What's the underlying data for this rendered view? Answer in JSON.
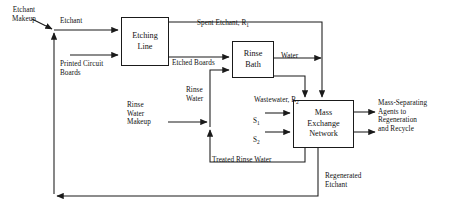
{
  "diagram": {
    "type": "process-flow-diagram",
    "stroke_color": "#1a1a1a",
    "text_color": "#111111",
    "background": "#ffffff",
    "boxes": [
      {
        "id": "etching-line",
        "label": "Etching\nLine",
        "x": 121,
        "y": 17,
        "w": 48,
        "h": 49
      },
      {
        "id": "rinse-bath",
        "label": "Rinse\nBath",
        "x": 232,
        "y": 41,
        "w": 42,
        "h": 37
      },
      {
        "id": "mass-exchange-network",
        "label": "Mass\nExchange\nNetwork",
        "x": 293,
        "y": 100,
        "w": 61,
        "h": 48
      }
    ],
    "labels": [
      {
        "id": "etchant-makeup",
        "text": "Etchant\nMakeup",
        "x": 4,
        "y": 6
      },
      {
        "id": "etchant",
        "text": "Etchant",
        "x": 60,
        "y": 17
      },
      {
        "id": "printed-circuit-boards",
        "text": "Printed Circuit\nBoards",
        "x": 60,
        "y": 60
      },
      {
        "id": "spent-etchant",
        "text": "Spent Etchant, R",
        "subscript": "1",
        "x": 197,
        "y": 10
      },
      {
        "id": "etched-boards",
        "text": "Etched Boards",
        "x": 172,
        "y": 59
      },
      {
        "id": "water",
        "text": "Water",
        "x": 281,
        "y": 52
      },
      {
        "id": "wastewater",
        "text": "Wastewater, R",
        "subscript": "2",
        "x": 254,
        "y": 87
      },
      {
        "id": "rinse-water",
        "text": "Rinse\nWater",
        "x": 186,
        "y": 86
      },
      {
        "id": "rinse-water-makeup",
        "text": "Rinse\nWater\nMakeup",
        "x": 127,
        "y": 110
      },
      {
        "id": "treated-rinse-water",
        "text": "Treated Rinse Water",
        "x": 212,
        "y": 157
      },
      {
        "id": "stream-s1",
        "text": "S",
        "subscript": "1",
        "x": 253,
        "y": 110
      },
      {
        "id": "stream-s2",
        "text": "S",
        "subscript": "2",
        "x": 253,
        "y": 129
      },
      {
        "id": "mass-separating-agents",
        "text": "Mass-Separating\nAgents to\nRegeneration\nand Recycle",
        "x": 378,
        "y": 99
      },
      {
        "id": "regenerated-etchant",
        "text": "Regenerated\nEtchant",
        "x": 325,
        "y": 172
      }
    ],
    "streams": [
      {
        "id": "etchant-makeup-feed",
        "from": "etchant-makeup",
        "to": "etchant-line"
      },
      {
        "id": "etchant-feed",
        "from": "etchant-junction",
        "to": "etching-line"
      },
      {
        "id": "printed-circuit-boards-feed",
        "from": "feed",
        "to": "etching-line"
      },
      {
        "id": "spent-etchant-R1",
        "from": "etching-line",
        "to": "mass-exchange-network"
      },
      {
        "id": "etched-boards-stream",
        "from": "etching-line",
        "to": "rinse-bath"
      },
      {
        "id": "rinse-water-feed",
        "from": "rinse-junction",
        "to": "rinse-bath"
      },
      {
        "id": "water-product",
        "from": "rinse-bath",
        "to": "product"
      },
      {
        "id": "wastewater-R2",
        "from": "rinse-bath",
        "to": "mass-exchange-network"
      },
      {
        "id": "rinse-water-makeup-feed",
        "from": "feed",
        "to": "rinse-junction"
      },
      {
        "id": "treated-rinse-water-recycle",
        "from": "mass-exchange-network",
        "to": "rinse-junction"
      },
      {
        "id": "stream-s1-feed",
        "from": "feed",
        "to": "mass-exchange-network"
      },
      {
        "id": "stream-s2-feed",
        "from": "feed",
        "to": "mass-exchange-network"
      },
      {
        "id": "msa-outlet-1",
        "from": "mass-exchange-network",
        "to": "regeneration"
      },
      {
        "id": "msa-outlet-2",
        "from": "mass-exchange-network",
        "to": "regeneration"
      },
      {
        "id": "regenerated-etchant-recycle",
        "from": "mass-exchange-network",
        "to": "etchant-junction"
      }
    ]
  }
}
